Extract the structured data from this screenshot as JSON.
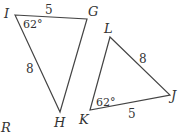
{
  "figure": {
    "triangle_1": {
      "vertices": {
        "I": "I",
        "G": "G",
        "H": "H"
      },
      "side_IG": "5",
      "side_IH": "8",
      "angle_I": "62°"
    },
    "triangle_2": {
      "vertices": {
        "L": "L",
        "J": "J",
        "K": "K"
      },
      "side_LJ": "8",
      "side_KJ": "5",
      "angle_K": "62°"
    },
    "stray_label": "R",
    "colors": {
      "line": "#444444",
      "text": "#333333",
      "background": "#ffffff"
    }
  }
}
